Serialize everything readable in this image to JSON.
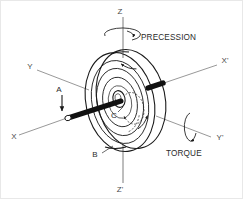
{
  "figure": {
    "background_color": "#ffffff",
    "ink_color": "#1a1a1a",
    "axis_color": "#7d7d7d"
  },
  "labels": {
    "z_top": "Z",
    "z_bottom": "Z'",
    "x_left": "X",
    "x_right": "X'",
    "y_left": "Y",
    "y_right": "Y'",
    "point_a": "A",
    "point_b": "B",
    "point_c": "C",
    "precession": "PRECESSION",
    "torque": "TORQUE"
  },
  "elements": {
    "rotor": "gyroscope-disc",
    "axle": "spin-axle-shaft",
    "hub": "rotor-hub",
    "precession_arrow": "precession-rotation-arrow",
    "torque_arrow": "torque-rotation-arrow",
    "spin_arrow": "rotor-spin-arrow",
    "force_arrow": "applied-force-arrow-a"
  },
  "axes": [
    {
      "name": "Z",
      "role": "precession-axis-up"
    },
    {
      "name": "Z'",
      "role": "precession-axis-down"
    },
    {
      "name": "X",
      "role": "spin-axis-near"
    },
    {
      "name": "X'",
      "role": "spin-axis-far"
    },
    {
      "name": "Y",
      "role": "torque-axis-near"
    },
    {
      "name": "Y'",
      "role": "torque-axis-far"
    }
  ]
}
